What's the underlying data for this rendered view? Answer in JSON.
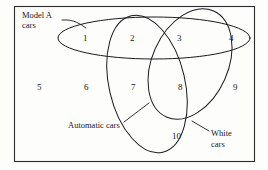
{
  "diagram": {
    "type": "venn-diagram",
    "title_visible": false,
    "universe": {
      "name": "universal-set-rectangle",
      "x": 14,
      "y": 6,
      "width": 241,
      "height": 156
    },
    "sets": [
      {
        "id": "model-a-cars",
        "label_lines": [
          "Model A",
          "cars"
        ],
        "label_x": 22,
        "label_y": 18,
        "shape": "horizontal-ellipse",
        "leader": "M 62 20 L 84 27"
      },
      {
        "id": "automatic-cars",
        "label_lines": [
          "Automatic cars"
        ],
        "label_x": 68,
        "label_y": 128,
        "shape": "tilted-ellipse-left",
        "leader": "M 124 122 L 148 104"
      },
      {
        "id": "white-cars",
        "label_lines": [
          "White",
          "cars"
        ],
        "label_x": 211,
        "label_y": 136,
        "shape": "tilted-ellipse-right",
        "leader": "M 208 130 L 193 122"
      }
    ],
    "regions": [
      {
        "id": "region-1",
        "number": "1",
        "x": 83,
        "y": 41
      },
      {
        "id": "region-2",
        "number": "2",
        "x": 130,
        "y": 41
      },
      {
        "id": "region-3",
        "number": "3",
        "x": 177,
        "y": 41
      },
      {
        "id": "region-4",
        "number": "4",
        "x": 229,
        "y": 41
      },
      {
        "id": "region-5",
        "number": "5",
        "x": 37,
        "y": 90
      },
      {
        "id": "region-6",
        "number": "6",
        "x": 84,
        "y": 90
      },
      {
        "id": "region-7",
        "number": "7",
        "x": 131,
        "y": 90
      },
      {
        "id": "region-8",
        "number": "8",
        "x": 178,
        "y": 90
      },
      {
        "id": "region-9",
        "number": "9",
        "x": 233,
        "y": 90
      },
      {
        "id": "region-10",
        "number": "10",
        "x": 175,
        "y": 139
      }
    ],
    "colors": {
      "background": "#fdfdfc",
      "stroke": "#1b1b1d",
      "text": "#18181a"
    }
  }
}
